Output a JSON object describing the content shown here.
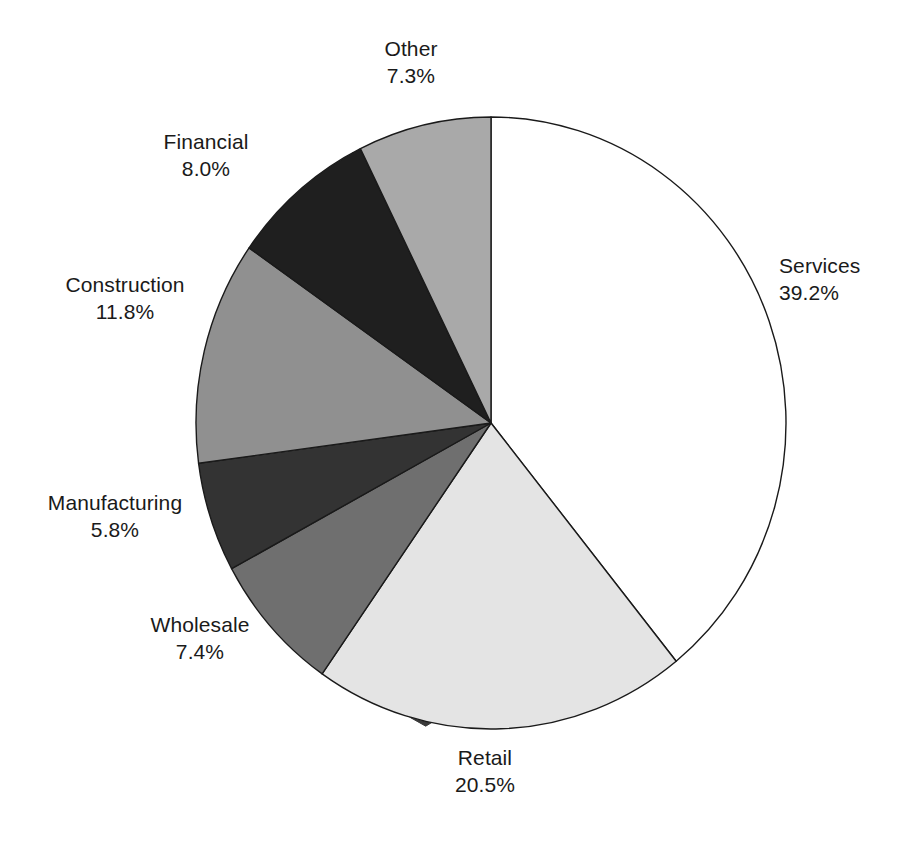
{
  "chart_data": {
    "type": "pie",
    "title": "",
    "subtitle": "",
    "xlabel": "",
    "ylabel": "",
    "legend_position": "none",
    "grid": false,
    "units": "percent",
    "start_angle_deg": 0,
    "direction": "clockwise",
    "categories": [
      "Services",
      "Retail",
      "Wholesale",
      "Manufacturing",
      "Construction",
      "Financial",
      "Other"
    ],
    "values": [
      39.2,
      20.5,
      7.4,
      5.8,
      11.8,
      8.0,
      7.3
    ],
    "slices": [
      {
        "name": "Services",
        "value": 39.2,
        "label": "Services",
        "value_label": "39.2%",
        "color": "#ffffff",
        "start_deg": 0.0,
        "end_deg": 141.12,
        "label_position": "right"
      },
      {
        "name": "Retail",
        "value": 20.5,
        "label": "Retail",
        "value_label": "20.5%",
        "color": "#e4e4e4",
        "start_deg": 141.12,
        "end_deg": 214.92,
        "label_position": "bottom"
      },
      {
        "name": "Wholesale",
        "value": 7.4,
        "label": "Wholesale",
        "value_label": "7.4%",
        "color": "#6f6f6f",
        "start_deg": 214.92,
        "end_deg": 241.56,
        "label_position": "bottom-left"
      },
      {
        "name": "Manufacturing",
        "value": 5.8,
        "label": "Manufacturing",
        "value_label": "5.8%",
        "color": "#333333",
        "start_deg": 241.56,
        "end_deg": 262.44,
        "label_position": "left"
      },
      {
        "name": "Construction",
        "value": 11.8,
        "label": "Construction",
        "value_label": "11.8%",
        "color": "#909090",
        "start_deg": 262.44,
        "end_deg": 304.92,
        "label_position": "left"
      },
      {
        "name": "Financial",
        "value": 8.0,
        "label": "Financial",
        "value_label": "8.0%",
        "color": "#1f1f1f",
        "start_deg": 304.92,
        "end_deg": 333.72,
        "label_position": "top-left"
      },
      {
        "name": "Other",
        "value": 7.3,
        "label": "Other",
        "value_label": "7.3%",
        "color": "#a9a9a9",
        "start_deg": 333.72,
        "end_deg": 360.0,
        "label_position": "top"
      }
    ],
    "total": 100.0,
    "style": {
      "rim_color": "#3a3a3a",
      "outline_color": "#1a1a1a",
      "background": "#ffffff",
      "three_d_rim": true
    }
  },
  "labels": {
    "services": {
      "name": "Services",
      "value": "39.2%"
    },
    "retail": {
      "name": "Retail",
      "value": "20.5%"
    },
    "wholesale": {
      "name": "Wholesale",
      "value": "7.4%"
    },
    "manufacturing": {
      "name": "Manufacturing",
      "value": "5.8%"
    },
    "construction": {
      "name": "Construction",
      "value": "11.8%"
    },
    "financial": {
      "name": "Financial",
      "value": "8.0%"
    },
    "other": {
      "name": "Other",
      "value": "7.3%"
    }
  }
}
